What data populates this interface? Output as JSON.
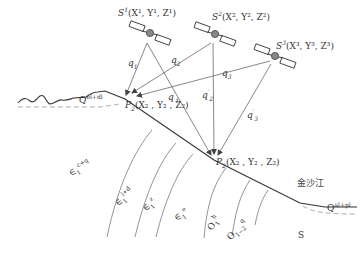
{
  "diagram": {
    "type": "satellite-positioning-geological-cross-section",
    "satellites": [
      {
        "id": "S1",
        "name": "S",
        "index": "1",
        "coords": "(X¹, Y¹, Z¹)"
      },
      {
        "id": "S2",
        "name": "S",
        "index": "2",
        "coords": "(X², Y², Z²)"
      },
      {
        "id": "S3",
        "name": "S",
        "index": "3",
        "coords": "(X³, Y³, Z³)"
      }
    ],
    "points": [
      {
        "id": "P1",
        "name": "P",
        "sub": "2",
        "coords": "(X₂ , Y₂ , Z₂)"
      },
      {
        "id": "P2",
        "name": "P",
        "sub": "2",
        "coords": "(X₂ , Y₂ , Z₂)"
      }
    ],
    "ranges": {
      "q1": {
        "name": "q",
        "sub": "1"
      },
      "q2": {
        "name": "q",
        "sub": "2"
      },
      "q3": {
        "name": "q",
        "sub": "3"
      },
      "q1p": {
        "name": "q",
        "sub": "1",
        "prime": "′"
      },
      "q2p": {
        "name": "q",
        "sub": "2",
        "prime": "′"
      },
      "q3p": {
        "name": "q",
        "sub": "3",
        "prime": "′"
      }
    },
    "strata": [
      {
        "id": "e1c_q",
        "symbol": "∈",
        "sub": "1",
        "sup": "c+q"
      },
      {
        "id": "e1l_d",
        "symbol": "∈",
        "sub": "1",
        "sup": "l+d"
      },
      {
        "id": "e1z",
        "symbol": "∈",
        "sub": "1",
        "sup": "z"
      },
      {
        "id": "e1e",
        "symbol": "∈",
        "sub": "1",
        "sup": "e"
      },
      {
        "id": "o1h",
        "symbol": "O",
        "sub": "1",
        "sup": "h"
      },
      {
        "id": "o12q",
        "symbol": "O",
        "sub": "1−2",
        "sup": "q"
      },
      {
        "id": "s",
        "symbol": "S",
        "sub": "",
        "sup": ""
      }
    ],
    "quaternary": [
      {
        "id": "q_top",
        "symbol": "Q",
        "sup": "el+dl"
      },
      {
        "id": "q_river",
        "symbol": "Q",
        "sup": "al+pl"
      }
    ],
    "river_label": "金沙江",
    "colors": {
      "line": "#333333",
      "thin_line": "#666666",
      "dashed": "#888888",
      "satellite_body": "#777777"
    }
  }
}
